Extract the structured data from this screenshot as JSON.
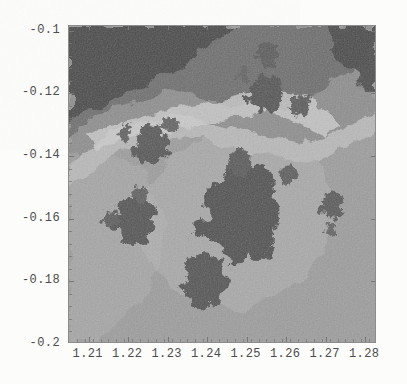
{
  "figure": {
    "kind": "density-plot",
    "title": "",
    "frame": {
      "visible": true,
      "ticks_inward": true,
      "border_color": "#8c8c8c"
    },
    "background_color": "#fcfcfa"
  },
  "chart_data": {
    "type": "heatmap",
    "title": "",
    "xlabel": "",
    "ylabel": "",
    "xlim": [
      1.205,
      1.283
    ],
    "ylim": [
      -0.2,
      -0.0985
    ],
    "xticks": [
      1.21,
      1.22,
      1.23,
      1.24,
      1.25,
      1.26,
      1.27,
      1.28
    ],
    "xtick_labels": [
      "1.21",
      "1.22",
      "1.23",
      "1.24",
      "1.25",
      "1.26",
      "1.27",
      "1.28"
    ],
    "yticks": [
      -0.1,
      -0.12,
      -0.14,
      -0.16,
      -0.18,
      -0.2
    ],
    "ytick_labels": [
      "-0.1",
      "-0.12",
      "-0.14",
      "-0.16",
      "-0.18",
      "-0.2"
    ],
    "x_minor_step": 0.002,
    "y_minor_step": 0.004,
    "grid": false,
    "legend": null,
    "colormap": "grayscale",
    "colormap_stops": [
      "#4a4a4a",
      "#6e6e6e",
      "#8e8e8e",
      "#9d9d9d",
      "#b9b9b9",
      "#cfcfcf"
    ],
    "value_range": [
      0,
      1
    ],
    "bands": [
      {
        "level": 0,
        "color": "#4a4a4a",
        "label": "darkest wedge (upper-left)"
      },
      {
        "level": 1,
        "color": "#6e6e6e",
        "label": "dark transition"
      },
      {
        "level": 2,
        "color": "#8e8e8e",
        "label": "mid grey"
      },
      {
        "level": 3,
        "color": "#9d9d9d",
        "label": "lower field"
      },
      {
        "level": 4,
        "color": "#b9b9b9",
        "label": "bright ridge"
      },
      {
        "level": 5,
        "color": "#cfcfcf",
        "label": "brightest filament"
      }
    ],
    "islands": [
      {
        "name": "main-island",
        "cx": 1.2492,
        "cy": -0.1585,
        "rx": 0.0082,
        "ry": 0.0135,
        "shade": "#535353"
      },
      {
        "name": "island-lower",
        "cx": 1.24,
        "cy": -0.18,
        "rx": 0.0046,
        "ry": 0.0078,
        "shade": "#575757"
      },
      {
        "name": "island-upper-mid",
        "cx": 1.2485,
        "cy": -0.1425,
        "rx": 0.0024,
        "ry": 0.004,
        "shade": "#5b5b5b"
      },
      {
        "name": "island-left",
        "cx": 1.222,
        "cy": -0.1605,
        "rx": 0.0042,
        "ry": 0.0068,
        "shade": "#575757"
      },
      {
        "name": "island-left-spur",
        "cx": 1.2157,
        "cy": -0.1605,
        "rx": 0.0016,
        "ry": 0.0022,
        "shade": "#5e5e5e"
      },
      {
        "name": "island-left-top",
        "cx": 1.2232,
        "cy": -0.1525,
        "rx": 0.0015,
        "ry": 0.0026,
        "shade": "#626262"
      },
      {
        "name": "island-nw",
        "cx": 1.2262,
        "cy": -0.1368,
        "rx": 0.0036,
        "ry": 0.0055,
        "shade": "#585858"
      },
      {
        "name": "island-nw-small",
        "cx": 1.2192,
        "cy": -0.1327,
        "rx": 0.0014,
        "ry": 0.0023,
        "shade": "#616161"
      },
      {
        "name": "island-nw-tail",
        "cx": 1.231,
        "cy": -0.13,
        "rx": 0.0019,
        "ry": 0.002,
        "shade": "#646464"
      },
      {
        "name": "island-ne-big",
        "cx": 1.2552,
        "cy": -0.1203,
        "rx": 0.0035,
        "ry": 0.0052,
        "shade": "#545454"
      },
      {
        "name": "island-ne-top",
        "cx": 1.256,
        "cy": -0.1075,
        "rx": 0.0022,
        "ry": 0.0034,
        "shade": "#5b5b5b"
      },
      {
        "name": "island-ne-left",
        "cx": 1.2495,
        "cy": -0.1145,
        "rx": 0.0013,
        "ry": 0.0021,
        "shade": "#636363"
      },
      {
        "name": "island-ne-right",
        "cx": 1.264,
        "cy": -0.1238,
        "rx": 0.0021,
        "ry": 0.0032,
        "shade": "#5d5d5d"
      },
      {
        "name": "island-e-mid",
        "cx": 1.261,
        "cy": -0.1465,
        "rx": 0.0018,
        "ry": 0.0028,
        "shade": "#5f5f5f"
      },
      {
        "name": "island-far-east",
        "cx": 1.272,
        "cy": -0.156,
        "rx": 0.0023,
        "ry": 0.0036,
        "shade": "#5b5b5b"
      },
      {
        "name": "island-far-e-low",
        "cx": 1.2718,
        "cy": -0.1638,
        "rx": 0.0012,
        "ry": 0.0018,
        "shade": "#656565"
      }
    ]
  }
}
